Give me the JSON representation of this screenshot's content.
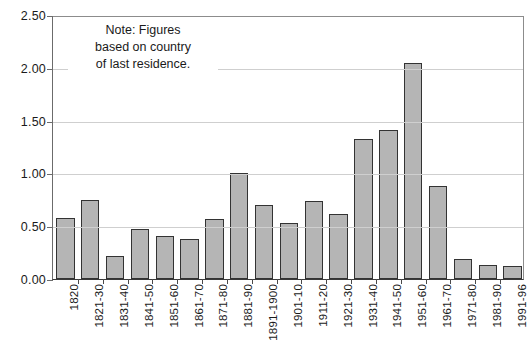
{
  "chart_data": {
    "type": "bar",
    "title": "",
    "subtitle": "",
    "xlabel": "",
    "ylabel": "",
    "ylim": [
      0.0,
      2.5
    ],
    "grid": true,
    "legend": "none",
    "y_ticks": [
      "0.00",
      "0.50",
      "1.00",
      "1.50",
      "2.00",
      "2.50"
    ],
    "y_tick_values": [
      0.0,
      0.5,
      1.0,
      1.5,
      2.0,
      2.5
    ],
    "categories": [
      "1820",
      "1821-30",
      "1831-40",
      "1841-50",
      "1851-60",
      "1861-70",
      "1871-80",
      "1881-90",
      "1891-1900",
      "1901-10",
      "1911-20",
      "1921-30",
      "1931-40",
      "1941-50",
      "1951-60",
      "1961-70",
      "1971-80",
      "1981-90",
      "1991-96"
    ],
    "values": [
      0.58,
      0.75,
      0.22,
      0.47,
      0.41,
      0.38,
      0.57,
      1.0,
      0.7,
      0.53,
      0.74,
      0.62,
      1.33,
      1.41,
      2.05,
      0.88,
      0.19,
      0.13,
      0.12
    ],
    "annotations": [
      "Note: Figures",
      "based on country",
      "of last residence."
    ],
    "colors": {
      "bar_fill": "#b5b5b5",
      "bar_border": "#333333",
      "gridline": "#cfcfcf",
      "axis": "#3a3a3a",
      "text": "#1a1a1a",
      "background": "#ffffff"
    }
  },
  "note": {
    "line1": "Note: Figures",
    "line2": "based on country",
    "line3": "of last residence."
  }
}
